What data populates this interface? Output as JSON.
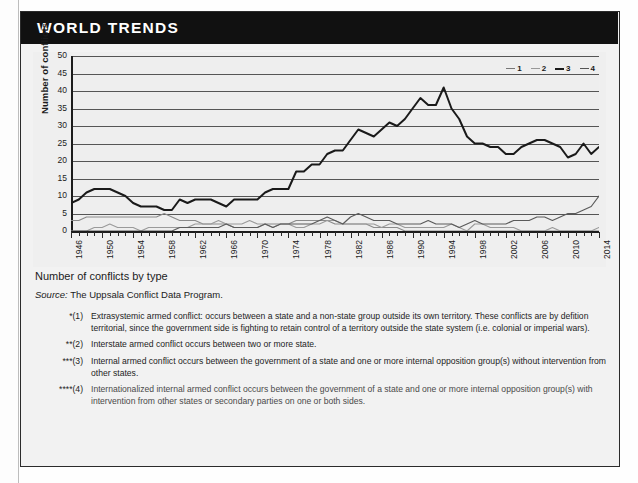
{
  "banner": {
    "title": "WORLD TRENDS"
  },
  "caption": {
    "title": "Number of conflicts by type",
    "source_word": "Source:",
    "source_text": " The Uppsala Conflict Data Program."
  },
  "legend": {
    "items": [
      {
        "label": "1",
        "color": "#777777",
        "style": "solid"
      },
      {
        "label": "2",
        "color": "#999999",
        "style": "solid"
      },
      {
        "label": "3",
        "color": "#1a1a1a",
        "style": "solid"
      },
      {
        "label": "4",
        "color": "#555555",
        "style": "solid"
      }
    ]
  },
  "footnotes": [
    {
      "mark": "*(1)",
      "text": "Extrasystemic armed conflict: occurs between a state and a non-state group outside its own territory. These conflicts are by defition territorial, since the government side is fighting to retain control of a territory outside the state system (i.e. colonial or imperial wars)."
    },
    {
      "mark": "**(2)",
      "text": "Interstate armed conflict occurs between two or more state."
    },
    {
      "mark": "***(3)",
      "text": "Internal armed conflict occurs between the government of a state and one or more internal opposition group(s) without intervention from other states."
    },
    {
      "mark": "****(4)",
      "text": "Internationalized internal armed conflict occurs between the government of a state and one or more internal opposition group(s) with intervention from other states or secondary parties on one or both sides."
    }
  ],
  "chart_data": {
    "type": "line",
    "title": "Number of conflicts by type",
    "xlabel": "",
    "ylabel": "Number of conflicts",
    "ylim": [
      0,
      50
    ],
    "ytick_step": 5,
    "yticks": [
      0,
      5,
      10,
      15,
      20,
      25,
      30,
      35,
      40,
      45,
      50
    ],
    "xlim": [
      1946,
      2014
    ],
    "grid": true,
    "legend_position": "top-right",
    "x": [
      1946,
      1947,
      1948,
      1949,
      1950,
      1951,
      1952,
      1953,
      1954,
      1955,
      1956,
      1957,
      1958,
      1959,
      1960,
      1961,
      1962,
      1963,
      1964,
      1965,
      1966,
      1967,
      1968,
      1969,
      1970,
      1971,
      1972,
      1973,
      1974,
      1975,
      1976,
      1977,
      1978,
      1979,
      1980,
      1981,
      1982,
      1983,
      1984,
      1985,
      1986,
      1987,
      1988,
      1989,
      1990,
      1991,
      1992,
      1993,
      1994,
      1995,
      1996,
      1997,
      1998,
      1999,
      2000,
      2001,
      2002,
      2003,
      2004,
      2005,
      2006,
      2007,
      2008,
      2009,
      2010,
      2011,
      2012,
      2013,
      2014
    ],
    "xtick_labels": [
      1946,
      1950,
      1954,
      1958,
      1962,
      1966,
      1970,
      1974,
      1978,
      1982,
      1986,
      1990,
      1994,
      1998,
      2002,
      2006,
      2010,
      2014
    ],
    "series": [
      {
        "name": "1",
        "label": "Extrasystemic armed conflict",
        "color": "#8a8a8a",
        "width": 1.1,
        "values": [
          3,
          3,
          4,
          4,
          4,
          4,
          4,
          4,
          4,
          4,
          4,
          4,
          5,
          4,
          3,
          3,
          3,
          2,
          2,
          2,
          2,
          1,
          1,
          1,
          1,
          2,
          2,
          2,
          2,
          3,
          3,
          3,
          3,
          3,
          2,
          2,
          2,
          2,
          2,
          1,
          1,
          1,
          1,
          0,
          0,
          0,
          0,
          0,
          0,
          0,
          0,
          0,
          0,
          0,
          0,
          0,
          0,
          0,
          0,
          0,
          0,
          0,
          0,
          0,
          0,
          0,
          0,
          0,
          0
        ]
      },
      {
        "name": "2",
        "label": "Interstate armed conflict",
        "color": "#9a9a9a",
        "width": 1.1,
        "values": [
          0,
          0,
          0,
          1,
          1,
          2,
          1,
          1,
          1,
          0,
          1,
          1,
          1,
          1,
          1,
          1,
          2,
          2,
          2,
          3,
          2,
          2,
          2,
          3,
          2,
          2,
          1,
          2,
          2,
          1,
          1,
          2,
          2,
          3,
          3,
          2,
          2,
          2,
          2,
          2,
          1,
          2,
          2,
          1,
          1,
          1,
          1,
          1,
          1,
          2,
          1,
          0,
          2,
          2,
          1,
          1,
          1,
          1,
          0,
          0,
          0,
          0,
          1,
          0,
          0,
          0,
          0,
          0,
          1
        ]
      },
      {
        "name": "3",
        "label": "Internal armed conflict",
        "color": "#1a1a1a",
        "width": 2.0,
        "values": [
          8,
          9,
          11,
          12,
          12,
          12,
          11,
          10,
          8,
          7,
          7,
          7,
          6,
          6,
          9,
          8,
          9,
          9,
          9,
          8,
          7,
          9,
          9,
          9,
          9,
          11,
          12,
          12,
          12,
          17,
          17,
          19,
          19,
          22,
          23,
          23,
          26,
          29,
          28,
          27,
          29,
          31,
          30,
          32,
          35,
          38,
          36,
          36,
          41,
          35,
          32,
          27,
          25,
          25,
          24,
          24,
          22,
          22,
          24,
          25,
          26,
          26,
          25,
          24,
          21,
          22,
          25,
          22,
          24
        ]
      },
      {
        "name": "4",
        "label": "Internationalized internal armed conflict",
        "color": "#5b5b5b",
        "width": 1.2,
        "values": [
          0,
          0,
          0,
          0,
          0,
          0,
          0,
          0,
          0,
          0,
          0,
          0,
          0,
          0,
          1,
          1,
          1,
          1,
          1,
          1,
          2,
          1,
          1,
          1,
          1,
          2,
          1,
          2,
          2,
          2,
          2,
          2,
          3,
          4,
          3,
          2,
          4,
          5,
          4,
          3,
          3,
          3,
          2,
          2,
          2,
          2,
          3,
          2,
          2,
          2,
          1,
          2,
          3,
          2,
          2,
          2,
          2,
          3,
          3,
          3,
          4,
          4,
          3,
          4,
          5,
          5,
          6,
          7,
          10
        ]
      }
    ]
  }
}
